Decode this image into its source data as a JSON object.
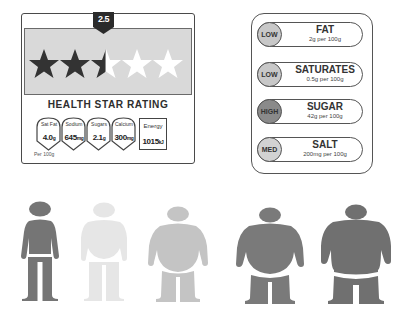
{
  "health_star_rating": {
    "rating_badge": "2.5",
    "stars_total": 5,
    "stars_filled": 2.5,
    "title": "HEALTH STAR RATING",
    "nutrients": [
      {
        "label": "Sat Fat",
        "value": "4.0",
        "unit": "g"
      },
      {
        "label": "Sodium",
        "value": "645",
        "unit": "mg"
      },
      {
        "label": "Sugars",
        "value": "2.1",
        "unit": "g"
      },
      {
        "label": "Calcium",
        "value": "300",
        "unit": "mg"
      }
    ],
    "energy": {
      "label": "Energy",
      "value": "1015",
      "unit": "kJ"
    },
    "per_note": "Per 100g",
    "colors": {
      "filled_star": "#333333",
      "empty_star": "#ffffff",
      "band": "#d9d9d9"
    }
  },
  "traffic_light": {
    "items": [
      {
        "level": "LOW",
        "name": "FAT",
        "amount": "2g per 100g",
        "color": "#c8c8c8"
      },
      {
        "level": "LOW",
        "name": "SATURATES",
        "amount": "0.5g per 100g",
        "color": "#c8c8c8"
      },
      {
        "level": "HIGH",
        "name": "SUGAR",
        "amount": "42g per 100g",
        "color": "#8a8a8a"
      },
      {
        "level": "MED",
        "name": "SALT",
        "amount": "200mg per 100g",
        "color": "#d2d2d2"
      }
    ]
  },
  "body_figures": [
    {
      "name": "normal",
      "color": "#757575"
    },
    {
      "name": "slim-pale",
      "color": "#e6e6e6"
    },
    {
      "name": "overweight",
      "color": "#c4c4c4"
    },
    {
      "name": "obese",
      "color": "#7a7a7a"
    },
    {
      "name": "severely-obese",
      "color": "#707070"
    }
  ]
}
